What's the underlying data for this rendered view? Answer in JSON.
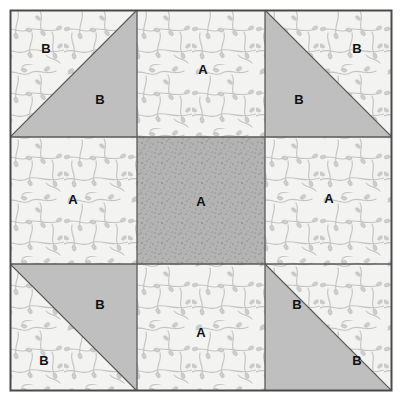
{
  "diagram": {
    "type": "quilt-block",
    "grid": {
      "rows": 3,
      "cols": 3
    },
    "border_color": "#4a4a4a",
    "seam_line_color": "#5a5a5a",
    "fabrics": {
      "print": {
        "name": "print-fabric",
        "label": "A",
        "base_color": "#f2f2f0",
        "motif_color": "#c2c2c2"
      },
      "solid": {
        "name": "solid-fabric",
        "label": "B",
        "base_color": "#bfbfbf"
      },
      "speckled": {
        "name": "speckled-fabric",
        "label": "A",
        "base_color": "#b2b2b2",
        "speck_color": "#6d6d6d"
      }
    },
    "units": [
      {
        "id": "top-left",
        "kind": "half-square-triangle",
        "row": 0,
        "col": 0,
        "orientation": "hypotenuse-tl-br",
        "print_label": "B",
        "solid_label": "B"
      },
      {
        "id": "top-center",
        "kind": "square",
        "row": 0,
        "col": 1,
        "fabric": "print",
        "label": "A"
      },
      {
        "id": "top-right",
        "kind": "half-square-triangle",
        "row": 0,
        "col": 2,
        "orientation": "hypotenuse-tl-br",
        "print_label": "B",
        "solid_label": "B"
      },
      {
        "id": "middle-left",
        "kind": "square",
        "row": 1,
        "col": 0,
        "fabric": "print",
        "label": "A"
      },
      {
        "id": "center",
        "kind": "square",
        "row": 1,
        "col": 1,
        "fabric": "speckled",
        "label": "A"
      },
      {
        "id": "middle-right",
        "kind": "square",
        "row": 1,
        "col": 2,
        "fabric": "print",
        "label": "A"
      },
      {
        "id": "bottom-left",
        "kind": "half-square-triangle",
        "row": 2,
        "col": 0,
        "orientation": "hypotenuse-tl-br",
        "print_label": "B",
        "solid_label": "B"
      },
      {
        "id": "bottom-center",
        "kind": "square",
        "row": 2,
        "col": 1,
        "fabric": "print",
        "label": "A"
      },
      {
        "id": "bottom-right",
        "kind": "half-square-triangle",
        "row": 2,
        "col": 2,
        "orientation": "hypotenuse-tl-br",
        "print_label": "B",
        "solid_label": "B"
      }
    ],
    "labels": {
      "top_left_print": "B",
      "top_left_solid": "B",
      "top_center": "A",
      "top_right_solid": "B",
      "top_right_print": "B",
      "middle_left": "A",
      "center": "A",
      "middle_right": "A",
      "bottom_left_solid": "B",
      "bottom_left_print": "B",
      "bottom_center": "A",
      "bottom_right_solid": "B",
      "bottom_right_print": "B"
    }
  }
}
